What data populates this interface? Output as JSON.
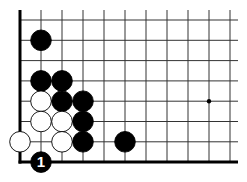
{
  "diagram": {
    "type": "go-board-fragment",
    "corner": "bottom-left",
    "grid": {
      "origin_x": 20,
      "origin_y": 20,
      "spacing_x": 21,
      "spacing_y": 20.3,
      "columns": 11,
      "rows": 8,
      "right_extent": 238,
      "edge_left": true,
      "edge_bottom": true
    },
    "star_points": [
      {
        "col": 9,
        "row": 4
      }
    ],
    "stones": [
      {
        "color": "black",
        "col": 1,
        "row": 1
      },
      {
        "color": "black",
        "col": 1,
        "row": 3
      },
      {
        "color": "black",
        "col": 2,
        "row": 3
      },
      {
        "color": "white",
        "col": 1,
        "row": 4
      },
      {
        "color": "black",
        "col": 2,
        "row": 4
      },
      {
        "color": "black",
        "col": 3,
        "row": 4
      },
      {
        "color": "white",
        "col": 1,
        "row": 5
      },
      {
        "color": "white",
        "col": 2,
        "row": 5
      },
      {
        "color": "black",
        "col": 3,
        "row": 5
      },
      {
        "color": "white",
        "col": 0,
        "row": 6
      },
      {
        "color": "white",
        "col": 2,
        "row": 6
      },
      {
        "color": "black",
        "col": 3,
        "row": 6
      },
      {
        "color": "black",
        "col": 5,
        "row": 6
      },
      {
        "color": "black",
        "col": 1,
        "row": 7,
        "label": "1"
      }
    ],
    "colors": {
      "black": "#000000",
      "white": "#ffffff",
      "line": "#333333"
    }
  }
}
